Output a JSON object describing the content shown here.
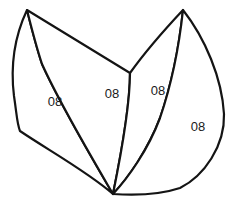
{
  "figure": {
    "type": "line-drawing",
    "background_color": "#ffffff",
    "stroke_color": "#141414",
    "fill_color": "#ffffff",
    "stroke_width": 2.2,
    "width": 235,
    "height": 202,
    "anchor_points": {
      "top_left_apex": [
        27,
        10
      ],
      "top_right_apex": [
        183,
        10
      ],
      "bottom_convergence": [
        113,
        194
      ],
      "middle_junction": [
        130,
        73
      ]
    },
    "regions": [
      {
        "id": "region-outer-left",
        "label": "08",
        "label_x": 55,
        "label_y": 103,
        "path": "M27,10 C12,42 11,72 14,96 C17,116 17,124 20,131 C48,150 88,172 113,194 C92,158 60,104 42,64 C36,46 31,26 27,10 Z"
      },
      {
        "id": "region-inner-left",
        "label": "08",
        "label_x": 112,
        "label_y": 95,
        "path": "M27,10 C63,32 102,56 130,73 C130,100 124,140 113,194 C92,158 60,104 42,64 C36,46 31,26 27,10 Z"
      },
      {
        "id": "region-inner-right",
        "label": "08",
        "label_x": 158,
        "label_y": 92,
        "path": "M130,73 C145,52 168,26 183,10 C180,38 173,80 160,118 C148,150 128,178 113,194 C124,140 130,100 130,73 Z"
      },
      {
        "id": "region-outer-right",
        "label": "08",
        "label_x": 198,
        "label_y": 128,
        "path": "M183,10 C205,38 222,78 224,114 C225,146 204,176 180,188 C156,196 128,195 113,194 C128,178 148,150 160,118 C173,80 180,38 183,10 Z"
      }
    ]
  }
}
